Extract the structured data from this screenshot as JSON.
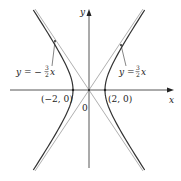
{
  "figure": {
    "axes": {
      "x_label": "x",
      "y_label": "y",
      "origin_label": "0"
    },
    "vertices": [
      {
        "label": "(−2, 0)",
        "x": -2,
        "y": 0
      },
      {
        "label": "(2, 0)",
        "x": 2,
        "y": 0
      }
    ],
    "asymptotes": [
      {
        "lhs": "y = −",
        "num": "3",
        "den": "2",
        "var": "x",
        "slope": -1.5
      },
      {
        "lhs": "y = ",
        "num": "3",
        "den": "2",
        "var": "x",
        "slope": 1.5
      }
    ],
    "colors": {
      "curve": "#333333",
      "asymptote": "#999999",
      "axis": "#444444"
    }
  }
}
